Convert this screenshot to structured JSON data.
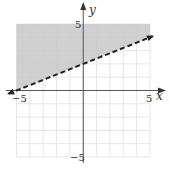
{
  "chart_data": {
    "type": "line",
    "title": "",
    "xlabel": "x",
    "ylabel": "y",
    "xlim": [
      -5,
      5
    ],
    "ylim": [
      -5,
      5
    ],
    "grid": true,
    "x_ticks_labeled": [
      "-5",
      "5"
    ],
    "y_ticks_labeled": [
      "5",
      "-5"
    ],
    "series": [
      {
        "name": "boundary",
        "style": "dashed",
        "equation": "y = 0.4x + 2",
        "x": [
          -5,
          5
        ],
        "y": [
          0,
          4
        ]
      }
    ],
    "shaded_region": "above boundary (y > 0.4x + 2)",
    "shade_color": "#c8c8c8",
    "grid_color": "#e6e6e6",
    "axis_color": "#555555",
    "line_color": "#222222"
  },
  "labels": {
    "x_axis": "x",
    "y_axis": "y",
    "x_min": "−5",
    "x_max": "5",
    "y_max": "5",
    "y_min": "−5"
  }
}
